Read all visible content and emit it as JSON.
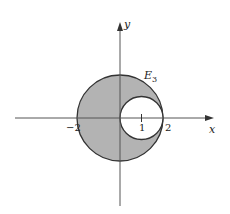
{
  "diagram": {
    "region_label": "E",
    "region_subscript": "3",
    "axes": {
      "x_label": "x",
      "y_label": "y"
    },
    "ticks": {
      "neg2": "−2",
      "one": "1",
      "two": "2"
    },
    "colors": {
      "shade": "#b3b3b3",
      "stroke": "#333333",
      "hole": "#ffffff"
    },
    "shapes": {
      "outer_circle": {
        "center": [
          0,
          0
        ],
        "radius": 2
      },
      "inner_circle": {
        "center": [
          1,
          0
        ],
        "radius": 1
      }
    }
  }
}
